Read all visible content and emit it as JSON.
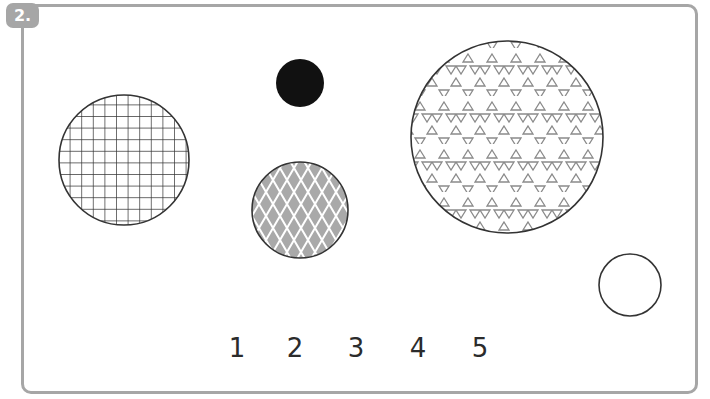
{
  "question": {
    "number_label": "2."
  },
  "shapes": [
    {
      "id": "grid-circle",
      "pattern": "square-grid",
      "cx": 124,
      "cy": 160,
      "r": 65,
      "fill": "#ffffff",
      "stroke": "#333333"
    },
    {
      "id": "black-circle",
      "pattern": "solid",
      "cx": 300,
      "cy": 83,
      "r": 24,
      "fill": "#111111",
      "stroke": "#111111"
    },
    {
      "id": "diamond-circle",
      "pattern": "diamond-lattice",
      "cx": 300,
      "cy": 210,
      "r": 48,
      "fill": "#a9a9a9",
      "stroke": "#333333"
    },
    {
      "id": "triangle-circle",
      "pattern": "triangles",
      "cx": 507,
      "cy": 137,
      "r": 96,
      "fill": "#ffffff",
      "stroke": "#333333"
    },
    {
      "id": "empty-circle",
      "pattern": "none",
      "cx": 630,
      "cy": 285,
      "r": 31,
      "fill": "#ffffff",
      "stroke": "#333333"
    }
  ],
  "answer_options": [
    {
      "label": "1",
      "x": 237
    },
    {
      "label": "2",
      "x": 295
    },
    {
      "label": "3",
      "x": 356
    },
    {
      "label": "4",
      "x": 418
    },
    {
      "label": "5",
      "x": 480
    }
  ],
  "colors": {
    "frame": "#a6a6a6",
    "badge": "#a6a6a6",
    "text": "#2b2b2b",
    "triangle": "#8a8a8a"
  }
}
